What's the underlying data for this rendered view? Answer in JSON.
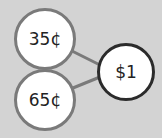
{
  "diagram": {
    "type": "number-bond",
    "parts": [
      {
        "label": "35¢"
      },
      {
        "label": "65¢"
      }
    ],
    "whole": {
      "label": "$1"
    },
    "colors": {
      "background": "#d3d3d3",
      "part_border": "#7a7a7a",
      "whole_border": "#2b2b2b",
      "connector": "#7a7a7a"
    }
  }
}
